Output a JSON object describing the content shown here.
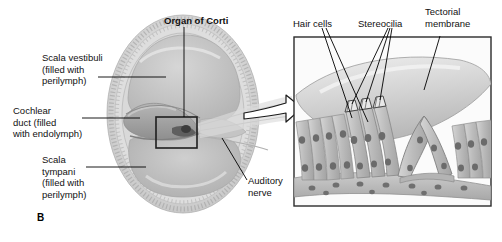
{
  "figure": {
    "panel_letter": "B",
    "title_bold": "Organ of Corti",
    "labels_left": [
      {
        "id": "scala-vestibuli",
        "text": "Scala vestibuli\n(filled with\nperilymph)"
      },
      {
        "id": "cochlear-duct",
        "text": "Cochlear\nduct (filled\nwith endolymph)"
      },
      {
        "id": "scala-tympani",
        "text": "Scala\ntympani\n(filled with\nperilymph)"
      }
    ],
    "labels_lower": [
      {
        "id": "auditory-nerve",
        "text": "Auditory\nnerve"
      }
    ],
    "labels_inset": [
      {
        "id": "hair-cells",
        "text": "Hair cells"
      },
      {
        "id": "stereocilia",
        "text": "Stereocilia"
      },
      {
        "id": "tectorial-membrane",
        "text": "Tectorial\nmembrane"
      }
    ],
    "colors": {
      "ink": "#111111",
      "leader": "#000000",
      "tissue_light": "#d8d8d8",
      "tissue_mid": "#bdbdbd",
      "tissue_dark": "#9a9a9a",
      "fluid": "#c9c9c9",
      "bone": "#cfcfcf",
      "footer_bar": "#9d9d9d",
      "footer_rule": "#3a3a3a",
      "box_stroke": "#2b2b2b"
    }
  }
}
